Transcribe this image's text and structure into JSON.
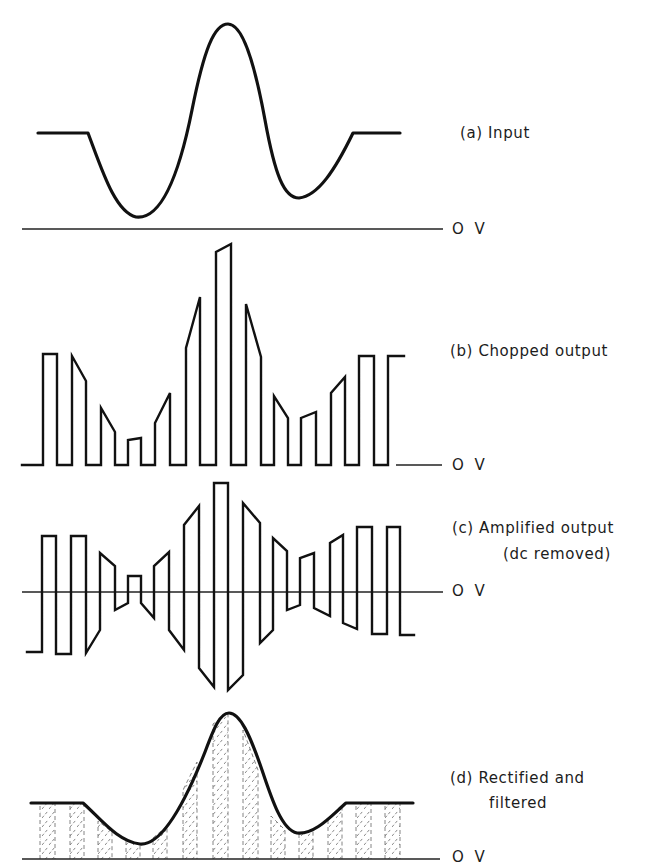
{
  "panels": {
    "a": {
      "label": "(a) Input",
      "zero_label": "O V"
    },
    "b": {
      "label": "(b) Chopped output",
      "zero_label": "O V"
    },
    "c": {
      "label_line1": "(c) Amplified output",
      "label_line2": "(dc removed)",
      "zero_label": "O V"
    },
    "d": {
      "label_line1": "(d) Rectified and",
      "label_line2": "filtered",
      "zero_label": "O V"
    }
  },
  "colors": {
    "ink": "#111111",
    "background": "#ffffff",
    "hatch": "#888888"
  }
}
